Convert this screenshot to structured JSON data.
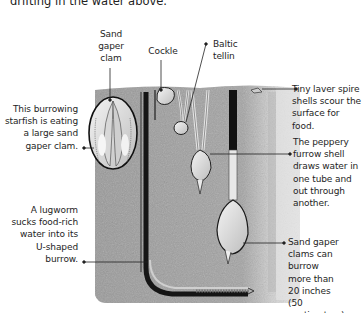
{
  "intro_text": "drifting in the water above.",
  "labels": {
    "sand_gaper_clam": [
      "Sand",
      "gaper",
      "clam"
    ],
    "cockle": "Cockle",
    "baltic_tellin": [
      "Baltic",
      "tellin"
    ],
    "starfish": [
      "This burrowing",
      "starfish is eating",
      "a large sand",
      "gaper clam."
    ],
    "lugworm": [
      "A lugworm",
      "sucks food-rich",
      "water into its",
      "U-shaped",
      "burrow."
    ],
    "laver_spire": [
      "Tiny laver spire",
      "shells scour the",
      "surface for food."
    ],
    "peppery_furrow": [
      "The peppery",
      "furrow shell",
      "draws water in",
      "one tube and",
      "out through",
      "another."
    ],
    "sand_gaper_depth": [
      "Sand gaper",
      "clams can burrow",
      "more than",
      "20 inches",
      "(50 centimeters)."
    ]
  },
  "colors": {
    "sand_dark": "#8f8f8f",
    "sand_mid": "#a9a9a9",
    "sand_light": "#d4d4d4",
    "shell": "#e6e6e6",
    "burrow": "#1c1c1c",
    "leader_line": "#222222"
  }
}
